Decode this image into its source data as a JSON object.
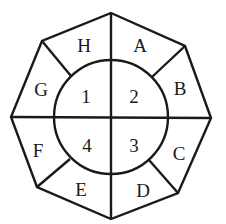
{
  "diagram": {
    "outer_regions": [
      "A",
      "B",
      "C",
      "D",
      "E",
      "F",
      "G",
      "H"
    ],
    "inner_regions": [
      "1",
      "2",
      "3",
      "4"
    ],
    "stroke_color": "#1a1a1a",
    "background_color": "#ffffff"
  }
}
